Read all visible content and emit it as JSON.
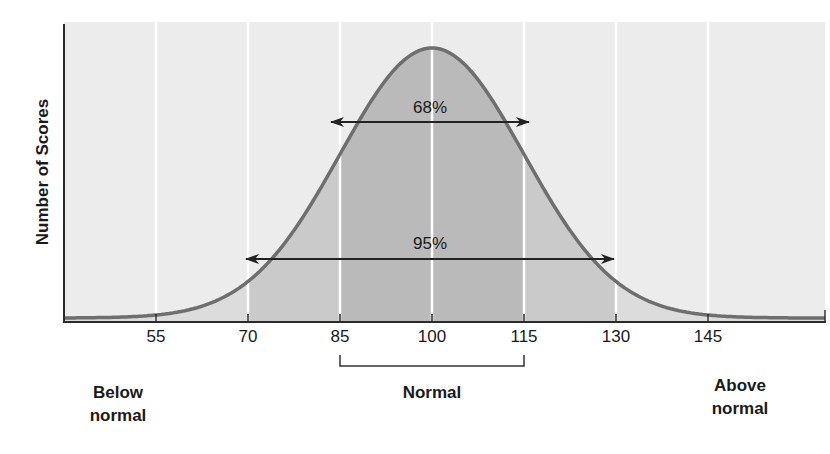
{
  "chart_data": {
    "type": "area",
    "title": "",
    "xlabel": "",
    "ylabel": "Number of Scores",
    "x_ticks": [
      55,
      70,
      85,
      100,
      115,
      130,
      145
    ],
    "xlim": [
      45,
      162
    ],
    "distribution": {
      "kind": "normal",
      "mean": 100,
      "sd": 15
    },
    "grid": {
      "vertical": true,
      "horizontal": false
    },
    "bands": [
      {
        "from": 45,
        "to": 70,
        "shade": "light"
      },
      {
        "from": 70,
        "to": 85,
        "shade": "medium"
      },
      {
        "from": 85,
        "to": 115,
        "shade": "dark"
      },
      {
        "from": 115,
        "to": 130,
        "shade": "medium"
      },
      {
        "from": 130,
        "to": 162,
        "shade": "light"
      }
    ],
    "annotations": [
      {
        "label": "68%",
        "from": 85,
        "to": 115,
        "type": "double-arrow"
      },
      {
        "label": "95%",
        "from": 70,
        "to": 130,
        "type": "double-arrow"
      }
    ],
    "categories": [
      {
        "label": "Below normal",
        "range": "< 70"
      },
      {
        "label": "Normal",
        "range": "85–115"
      },
      {
        "label": "Above normal",
        "range": "> 130"
      }
    ]
  },
  "axis": {
    "ylabel": "Number of Scores",
    "ticks": [
      "55",
      "70",
      "85",
      "100",
      "115",
      "130",
      "145"
    ]
  },
  "annotations": {
    "pct68": "68%",
    "pct95": "95%"
  },
  "categories": {
    "below_line1": "Below",
    "below_line2": "normal",
    "normal": "Normal",
    "above_line1": "Above",
    "above_line2": "normal"
  },
  "colors": {
    "background_light": "#e9e9e9",
    "band_light": "#dcdcdc",
    "band_medium": "#c9c9c9",
    "band_dark": "#b9b9b9",
    "curve": "#6a6a6a",
    "axis": "#2a2a2a",
    "gridline": "#ffffff"
  }
}
